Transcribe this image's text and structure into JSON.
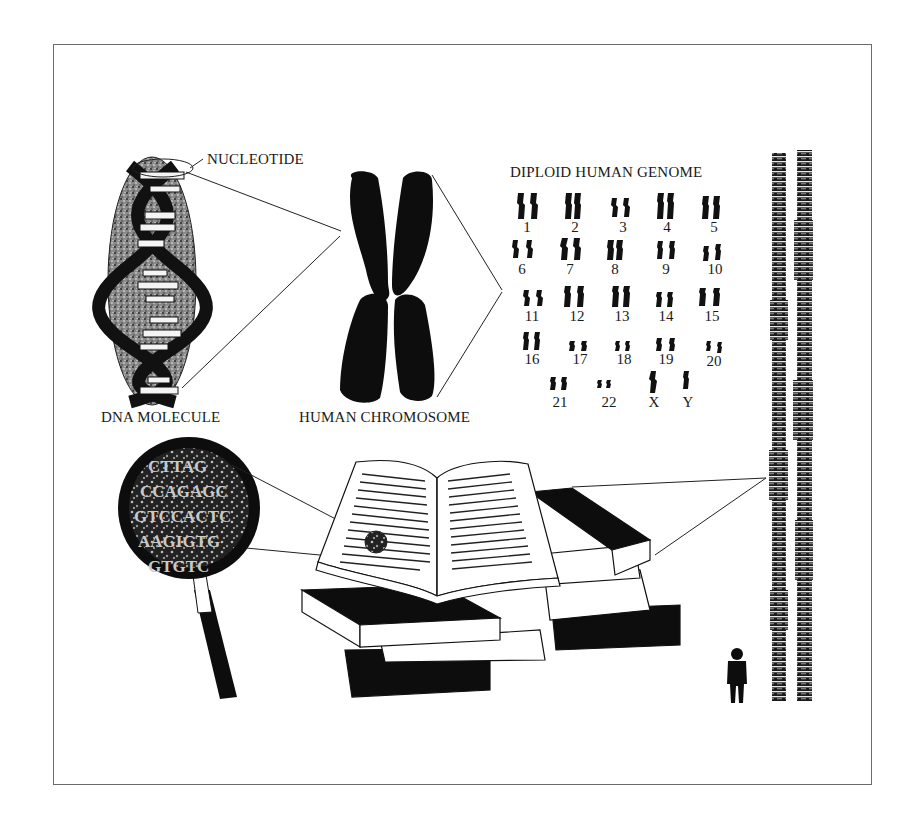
{
  "figure": {
    "labels": {
      "nucleotide": "NUCLEOTIDE",
      "dna_molecule": "DNA MOLECULE",
      "human_chromosome": "HUMAN CHROMOSOME",
      "diploid_genome": "DIPLOID HUMAN GENOME"
    },
    "karyotype": {
      "rows": [
        [
          "1",
          "2",
          "3",
          "4",
          "5"
        ],
        [
          "6",
          "7",
          "8",
          "9",
          "10"
        ],
        [
          "11",
          "12",
          "13",
          "14",
          "15"
        ],
        [
          "16",
          "17",
          "18",
          "19",
          "20"
        ],
        [
          "21",
          "22",
          "X",
          "Y"
        ]
      ]
    },
    "magnifier_text": [
      "CTTAG",
      "CCAGAGC",
      "GTCCACTC",
      "AAGIGTG",
      "GTGTC"
    ],
    "panels": [
      "dna-molecule",
      "human-chromosome",
      "diploid-human-genome",
      "magnifying-glass",
      "open-book-on-stack",
      "book-stack-towers-with-person"
    ],
    "colors": {
      "ink": "#111111",
      "frame": "#6b6b6b",
      "background": "#ffffff",
      "stipple": "#5a5a5a"
    }
  }
}
